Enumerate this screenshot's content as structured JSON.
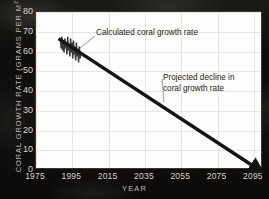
{
  "chart_data": {
    "type": "line",
    "title": "",
    "xlabel": "YEAR",
    "ylabel": "CORAL GROWTH RATE (GRAMS PER M",
    "ylabel_exponent": "2",
    "ylabel_full": "CORAL GROWTH RATE (GRAMS PER M2)",
    "xlim": [
      1975,
      2100
    ],
    "ylim": [
      0,
      80
    ],
    "xticks": [
      "1975",
      "1995",
      "2015",
      "2035",
      "2055",
      "2075",
      "2095"
    ],
    "xtick_values": [
      1975,
      1995,
      2015,
      2035,
      2055,
      2075,
      2095
    ],
    "yticks": [
      "0",
      "10",
      "20",
      "30",
      "40",
      "50",
      "60",
      "70",
      "80"
    ],
    "ytick_values": [
      0,
      10,
      20,
      30,
      40,
      50,
      60,
      70,
      80
    ],
    "grid": true,
    "legend": "none",
    "series": [
      {
        "name": "Calculated coral growth rate",
        "type": "line",
        "color": "#3a3a3a",
        "x": [
          1989.0,
          1989.4,
          1989.8,
          1990.2,
          1990.6,
          1991.0,
          1991.4,
          1991.8,
          1992.2,
          1992.6,
          1993.0,
          1993.4,
          1993.8,
          1994.2,
          1994.6,
          1995.0,
          1995.4,
          1995.8,
          1996.2,
          1996.6,
          1997.0,
          1997.4,
          1997.8,
          1998.2,
          1998.6,
          1999.0,
          1999.4,
          1999.8,
          2000.2
        ],
        "values": [
          66,
          61,
          67,
          60,
          65,
          59,
          66,
          61,
          64,
          58,
          67,
          60,
          63,
          57,
          66,
          59,
          64,
          56,
          65,
          58,
          62,
          55,
          64,
          57,
          61,
          54,
          62,
          56,
          58
        ]
      },
      {
        "name": "Projected decline in coral growth rate",
        "type": "arrow",
        "color": "#141414",
        "x": [
          1988,
          2096
        ],
        "values": [
          66,
          1
        ]
      }
    ],
    "annotations": [
      {
        "id": "calculated",
        "text": "Calculated coral growth rate",
        "target_x": 1998,
        "target_y": 60
      },
      {
        "id": "projected",
        "text": "Projected decline in\ncoral growth rate",
        "target_x": 2046,
        "target_y": 34
      }
    ],
    "colors": {
      "plot_background": "#fdfdfb",
      "page_background": "#100f0d",
      "grid": "#e6e6e2",
      "tick_text": "#d9d6cf",
      "axis_title": "#bdbab3",
      "annotation_text": "#1d1b17",
      "data_line": "#3a3a3a",
      "arrow": "#141414"
    }
  }
}
